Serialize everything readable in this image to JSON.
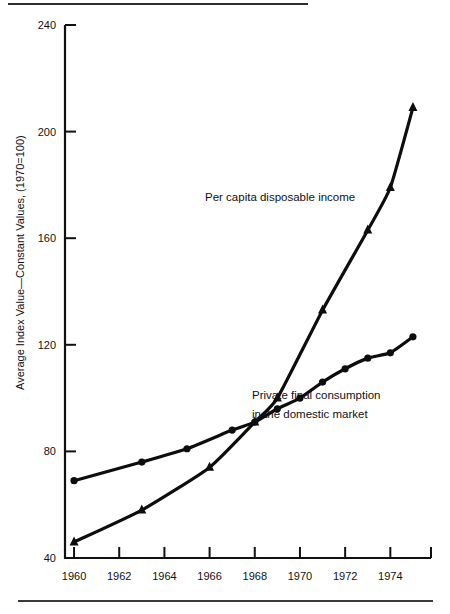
{
  "figure": {
    "rules": {
      "top_rule": "top-divider",
      "bottom_rule": "bottom-divider"
    }
  },
  "chart_data": {
    "type": "line",
    "title": "",
    "xlabel": "",
    "ylabel": "Average Index Value—Constant Values, (1970=100)",
    "xlim": [
      1959.6,
      1975.8
    ],
    "ylim": [
      40,
      240
    ],
    "grid": false,
    "legend_position": "inline-annotation",
    "yticks": [
      40,
      80,
      120,
      160,
      200,
      240
    ],
    "ytick_labels": [
      "40",
      "80",
      "120",
      "160",
      "200",
      "240"
    ],
    "xticks": [
      1960,
      1962,
      1964,
      1966,
      1968,
      1970,
      1972,
      1974,
      1975.8
    ],
    "xtick_labels": [
      "1960",
      "1962",
      "1964",
      "1966",
      "1968",
      "1970",
      "1972",
      "1974",
      ""
    ],
    "series": [
      {
        "name": "Per capita disposable income",
        "marker": "triangle",
        "annotation": "Per capita disposable income",
        "x": [
          1960,
          1963,
          1966,
          1968,
          1969,
          1971,
          1973,
          1974,
          1975
        ],
        "values": [
          46,
          58,
          74,
          91,
          100,
          133,
          163,
          179,
          209
        ]
      },
      {
        "name": "Private final consumption in the domestic market",
        "marker": "circle",
        "annotation_line1": "Private final consumption",
        "annotation_line2": "in the domestic market",
        "x": [
          1960,
          1963,
          1965,
          1967,
          1968,
          1969,
          1970,
          1971,
          1972,
          1973,
          1974,
          1975
        ],
        "values": [
          69,
          76,
          81,
          88,
          91,
          96,
          100,
          106,
          111,
          115,
          117,
          123
        ]
      }
    ]
  }
}
